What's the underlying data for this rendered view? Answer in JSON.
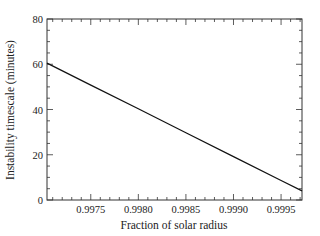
{
  "chart_data": {
    "type": "line",
    "title": "",
    "xlabel": "Fraction of solar radius",
    "ylabel": "Instability timescale (minutes)",
    "xlim": [
      0.99704,
      0.99972
    ],
    "ylim": [
      0,
      80
    ],
    "xticks": [
      0.9975,
      0.998,
      0.9985,
      0.999,
      0.9995
    ],
    "xtick_labels": [
      "0.9975",
      "0.9980",
      "0.9985",
      "0.9990",
      "0.9995"
    ],
    "yticks": [
      0,
      20,
      40,
      60,
      80
    ],
    "ytick_labels": [
      "0",
      "20",
      "40",
      "60",
      "80"
    ],
    "grid": false,
    "legend": null,
    "series": [
      {
        "name": "Instability timescale",
        "x": [
          0.99704,
          0.9975,
          0.998,
          0.9985,
          0.999,
          0.9995,
          0.99972
        ],
        "y": [
          60.5,
          50.8,
          40.3,
          29.7,
          19.2,
          8.6,
          4.0
        ]
      }
    ]
  }
}
